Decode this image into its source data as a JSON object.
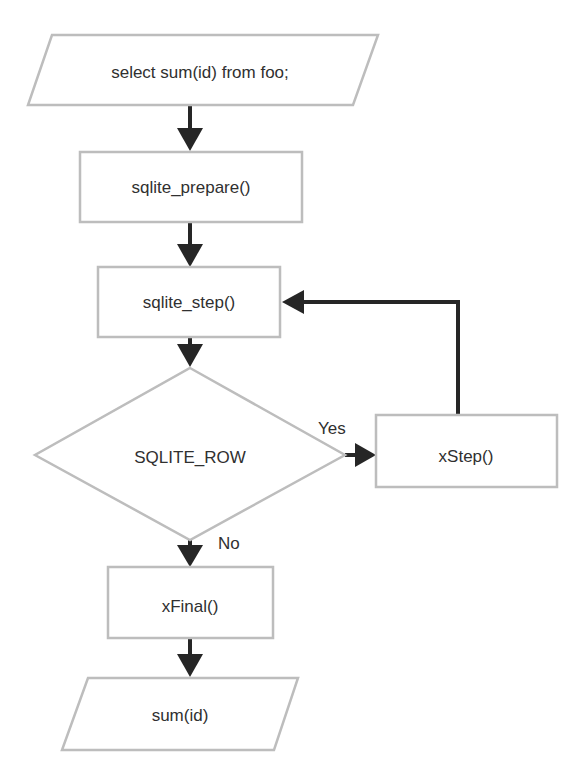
{
  "diagram": {
    "type": "flowchart",
    "nodes": {
      "query": {
        "shape": "parallelogram",
        "label": "select sum(id) from foo;"
      },
      "prepare": {
        "shape": "rectangle",
        "label": "sqlite_prepare()"
      },
      "step": {
        "shape": "rectangle",
        "label": "sqlite_step()"
      },
      "decision": {
        "shape": "diamond",
        "label": "SQLITE_ROW"
      },
      "xstep": {
        "shape": "rectangle",
        "label": "xStep()"
      },
      "xfinal": {
        "shape": "rectangle",
        "label": "xFinal()"
      },
      "result": {
        "shape": "parallelogram",
        "label": "sum(id)"
      }
    },
    "edges": [
      {
        "from": "query",
        "to": "prepare",
        "label": ""
      },
      {
        "from": "prepare",
        "to": "step",
        "label": ""
      },
      {
        "from": "step",
        "to": "decision",
        "label": ""
      },
      {
        "from": "decision",
        "to": "xstep",
        "label": "Yes"
      },
      {
        "from": "xstep",
        "to": "step",
        "label": ""
      },
      {
        "from": "decision",
        "to": "xfinal",
        "label": "No"
      },
      {
        "from": "xfinal",
        "to": "result",
        "label": ""
      }
    ],
    "edge_labels": {
      "yes": "Yes",
      "no": "No"
    },
    "colors": {
      "shape_border": "#bdbdbd",
      "arrow": "#262626",
      "text": "#303030",
      "background": "#ffffff"
    }
  }
}
